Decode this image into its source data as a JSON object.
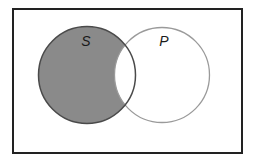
{
  "diagram": {
    "type": "venn",
    "universe": {
      "x": 13,
      "y": 9,
      "width": 229,
      "height": 144,
      "stroke": "#222222",
      "stroke_width": 2,
      "fill": "#ffffff"
    },
    "sets": [
      {
        "id": "S",
        "label": "S",
        "cx": 87,
        "cy": 75,
        "r": 48.5,
        "stroke": "#4a4a4a",
        "shaded": true,
        "label_x": 86,
        "label_y": 46
      },
      {
        "id": "P",
        "label": "P",
        "cx": 162,
        "cy": 75,
        "r": 47.5,
        "stroke": "#9a9a9a",
        "shaded": false,
        "label_x": 164,
        "label_y": 46
      }
    ],
    "shaded_region": "S minus P",
    "shade_color": "#8a8a8a",
    "intersection_fill": "#ffffff"
  }
}
